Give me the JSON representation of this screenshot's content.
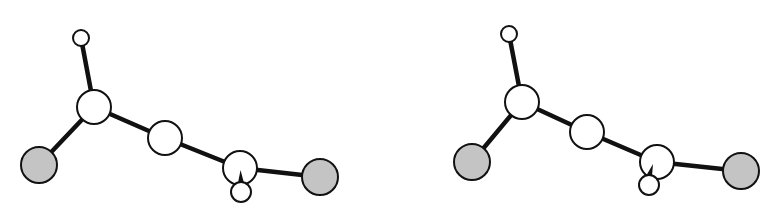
{
  "figure": {
    "colors": {
      "background": "#ffffff",
      "bond": "#111111",
      "atom_outline": "#111111",
      "atom_light": "#ffffff",
      "atom_halogen": "#c4c4c4"
    },
    "views": [
      {
        "name": "left-view",
        "atoms": [
          {
            "id": "h1",
            "type": "light-small",
            "x": 81,
            "y": 38,
            "r": 8
          },
          {
            "id": "c1",
            "type": "light",
            "x": 94,
            "y": 107,
            "r": 17
          },
          {
            "id": "x1",
            "type": "halogen",
            "x": 39,
            "y": 165,
            "r": 18
          },
          {
            "id": "c2",
            "type": "light",
            "x": 165,
            "y": 138,
            "r": 17
          },
          {
            "id": "c3",
            "type": "light",
            "x": 240,
            "y": 168,
            "r": 17
          },
          {
            "id": "h2",
            "type": "light-small",
            "x": 241,
            "y": 192,
            "r": 10
          },
          {
            "id": "x2",
            "type": "halogen",
            "x": 320,
            "y": 177,
            "r": 18
          }
        ],
        "bonds": [
          [
            "h1",
            "c1"
          ],
          [
            "c1",
            "x1"
          ],
          [
            "c1",
            "c2"
          ],
          [
            "c2",
            "c3"
          ],
          [
            "c3",
            "x2"
          ]
        ]
      },
      {
        "name": "right-view",
        "atoms": [
          {
            "id": "h1",
            "type": "light-small",
            "x": 509,
            "y": 34,
            "r": 8
          },
          {
            "id": "c1",
            "type": "light",
            "x": 522,
            "y": 102,
            "r": 17
          },
          {
            "id": "x1",
            "type": "halogen",
            "x": 472,
            "y": 162,
            "r": 18
          },
          {
            "id": "c2",
            "type": "light",
            "x": 587,
            "y": 132,
            "r": 17
          },
          {
            "id": "c3",
            "type": "light",
            "x": 657,
            "y": 162,
            "r": 17
          },
          {
            "id": "h2",
            "type": "light-small",
            "x": 649,
            "y": 185,
            "r": 10
          },
          {
            "id": "x2",
            "type": "halogen",
            "x": 741,
            "y": 171,
            "r": 18
          }
        ],
        "bonds": [
          [
            "h1",
            "c1"
          ],
          [
            "c1",
            "x1"
          ],
          [
            "c1",
            "c2"
          ],
          [
            "c2",
            "c3"
          ],
          [
            "c3",
            "x2"
          ]
        ]
      }
    ]
  }
}
